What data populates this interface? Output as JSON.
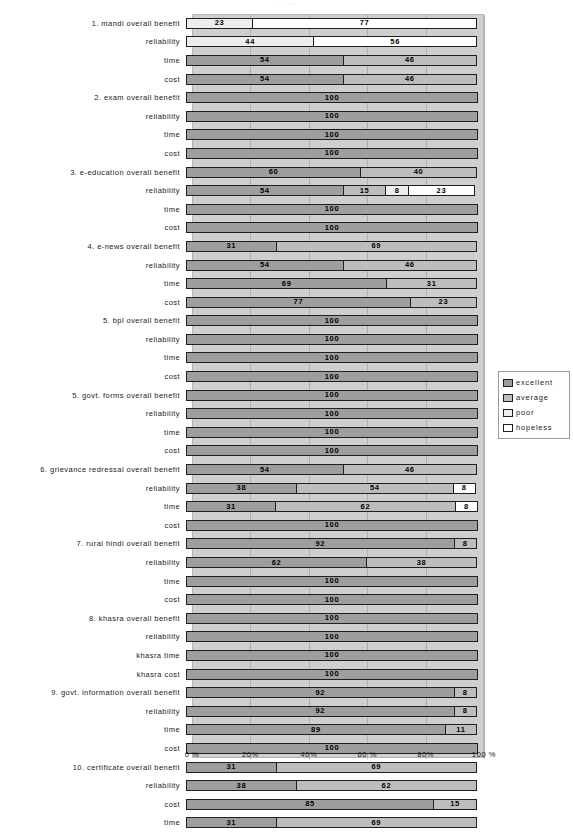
{
  "top_artifact_text": "·        ·                    ·                         ·",
  "chart_data": {
    "type": "bar",
    "subtype": "horizontal-stacked-100",
    "title": "",
    "xlabel": "",
    "ylabel": "",
    "xlim": [
      0,
      100
    ],
    "xticks": [
      "0 %",
      "20%",
      "40%",
      "60 %",
      "80%",
      "100 %"
    ],
    "xtick_values": [
      0,
      20,
      40,
      60,
      80,
      100
    ],
    "grid": true,
    "legend_position": "right",
    "legend": [
      "excellent",
      "average",
      "poor",
      "hopeless"
    ],
    "series_colors": {
      "excellent": "#9e9e9e",
      "average": "#bdbdbd",
      "poor": "#ededed",
      "hopeless": "#ffffff"
    },
    "categories": [
      "1. mandi overall benefit",
      "reliability",
      "time",
      "cost",
      "2. exam overall benefit",
      "reliability",
      "time",
      "cost",
      "3. e-education overall benefit",
      "reliability",
      "time",
      "cost",
      "4. e-news overall benefit",
      "reliability",
      "time",
      "cost",
      "5. bpl overall benefit",
      "reliability",
      "time",
      "cost",
      "5. govt. forms overall benefit",
      "reliability",
      "time",
      "cost",
      "6. grievance redressal overall benefit",
      "reliability",
      "time",
      "cost",
      "7. rural hindi overall benefit",
      "reliability",
      "time",
      "cost",
      "8. khasra overall benefit",
      "reliability",
      "khasra time",
      "khasra cost",
      "9. govt. information overall benefit",
      "reliability",
      "time",
      "cost",
      "10. certificate overall benefit",
      "reliability",
      "cost",
      "time"
    ],
    "rows": [
      {
        "label": "1. mandi overall benefit",
        "segments": [
          {
            "cls": "poor",
            "value": 23
          },
          {
            "cls": "hopeless",
            "value": 77
          }
        ]
      },
      {
        "label": "reliability",
        "segments": [
          {
            "cls": "poor",
            "value": 44
          },
          {
            "cls": "hopeless",
            "value": 56
          }
        ]
      },
      {
        "label": "time",
        "segments": [
          {
            "cls": "excellent",
            "value": 54
          },
          {
            "cls": "average",
            "value": 46
          }
        ]
      },
      {
        "label": "cost",
        "segments": [
          {
            "cls": "excellent",
            "value": 54
          },
          {
            "cls": "average",
            "value": 46
          }
        ]
      },
      {
        "label": "2. exam overall benefit",
        "segments": [
          {
            "cls": "excellent",
            "value": 100
          }
        ]
      },
      {
        "label": "reliability",
        "segments": [
          {
            "cls": "excellent",
            "value": 100
          }
        ]
      },
      {
        "label": "time",
        "segments": [
          {
            "cls": "excellent",
            "value": 100
          }
        ]
      },
      {
        "label": "cost",
        "segments": [
          {
            "cls": "excellent",
            "value": 100
          }
        ]
      },
      {
        "label": "3. e-education overall benefit",
        "segments": [
          {
            "cls": "excellent",
            "value": 60
          },
          {
            "cls": "average",
            "value": 40
          }
        ]
      },
      {
        "label": "reliability",
        "segments": [
          {
            "cls": "excellent",
            "value": 54
          },
          {
            "cls": "average",
            "value": 15
          },
          {
            "cls": "poor",
            "value": 8
          },
          {
            "cls": "hopeless",
            "value": 23
          }
        ]
      },
      {
        "label": "time",
        "segments": [
          {
            "cls": "excellent",
            "value": 100
          }
        ]
      },
      {
        "label": "cost",
        "segments": [
          {
            "cls": "excellent",
            "value": 100
          }
        ]
      },
      {
        "label": "4. e-news overall benefit",
        "segments": [
          {
            "cls": "excellent",
            "value": 31
          },
          {
            "cls": "average",
            "value": 69
          }
        ]
      },
      {
        "label": "reliability",
        "segments": [
          {
            "cls": "excellent",
            "value": 54
          },
          {
            "cls": "average",
            "value": 46
          }
        ]
      },
      {
        "label": "time",
        "segments": [
          {
            "cls": "excellent",
            "value": 69
          },
          {
            "cls": "average",
            "value": 31
          }
        ]
      },
      {
        "label": "cost",
        "segments": [
          {
            "cls": "excellent",
            "value": 77
          },
          {
            "cls": "average",
            "value": 23
          }
        ]
      },
      {
        "label": "5. bpl overall benefit",
        "segments": [
          {
            "cls": "excellent",
            "value": 100
          }
        ]
      },
      {
        "label": "reliability",
        "segments": [
          {
            "cls": "excellent",
            "value": 100
          }
        ]
      },
      {
        "label": "time",
        "segments": [
          {
            "cls": "excellent",
            "value": 100
          }
        ]
      },
      {
        "label": "cost",
        "segments": [
          {
            "cls": "excellent",
            "value": 100
          }
        ]
      },
      {
        "label": "5. govt. forms overall benefit",
        "segments": [
          {
            "cls": "excellent",
            "value": 100
          }
        ]
      },
      {
        "label": "reliability",
        "segments": [
          {
            "cls": "excellent",
            "value": 100
          }
        ]
      },
      {
        "label": "time",
        "segments": [
          {
            "cls": "excellent",
            "value": 100
          }
        ]
      },
      {
        "label": "cost",
        "segments": [
          {
            "cls": "excellent",
            "value": 100
          }
        ]
      },
      {
        "label": "6. grievance redressal overall benefit",
        "segments": [
          {
            "cls": "excellent",
            "value": 54
          },
          {
            "cls": "average",
            "value": 46
          }
        ]
      },
      {
        "label": "reliability",
        "segments": [
          {
            "cls": "excellent",
            "value": 38
          },
          {
            "cls": "average",
            "value": 54
          },
          {
            "cls": "hopeless",
            "value": 8
          }
        ]
      },
      {
        "label": "time",
        "segments": [
          {
            "cls": "excellent",
            "value": 31
          },
          {
            "cls": "average",
            "value": 62
          },
          {
            "cls": "hopeless",
            "value": 8
          }
        ]
      },
      {
        "label": "cost",
        "segments": [
          {
            "cls": "excellent",
            "value": 100
          }
        ]
      },
      {
        "label": "7. rural hindi overall benefit",
        "segments": [
          {
            "cls": "excellent",
            "value": 92
          },
          {
            "cls": "average",
            "value": 8
          }
        ]
      },
      {
        "label": "reliability",
        "segments": [
          {
            "cls": "excellent",
            "value": 62
          },
          {
            "cls": "average",
            "value": 38
          }
        ]
      },
      {
        "label": "time",
        "segments": [
          {
            "cls": "excellent",
            "value": 100
          }
        ]
      },
      {
        "label": "cost",
        "segments": [
          {
            "cls": "excellent",
            "value": 100
          }
        ]
      },
      {
        "label": "8. khasra overall benefit",
        "segments": [
          {
            "cls": "excellent",
            "value": 100
          }
        ]
      },
      {
        "label": "reliability",
        "segments": [
          {
            "cls": "excellent",
            "value": 100
          }
        ]
      },
      {
        "label": "khasra time",
        "segments": [
          {
            "cls": "excellent",
            "value": 100
          }
        ]
      },
      {
        "label": "khasra cost",
        "segments": [
          {
            "cls": "excellent",
            "value": 100
          }
        ]
      },
      {
        "label": "9. govt. information overall benefit",
        "segments": [
          {
            "cls": "excellent",
            "value": 92
          },
          {
            "cls": "average",
            "value": 8
          }
        ]
      },
      {
        "label": "reliability",
        "segments": [
          {
            "cls": "excellent",
            "value": 92
          },
          {
            "cls": "average",
            "value": 8
          }
        ]
      },
      {
        "label": "time",
        "segments": [
          {
            "cls": "excellent",
            "value": 89
          },
          {
            "cls": "average",
            "value": 11
          }
        ]
      },
      {
        "label": "cost",
        "segments": [
          {
            "cls": "excellent",
            "value": 100
          }
        ]
      },
      {
        "label": "10. certificate overall benefit",
        "segments": [
          {
            "cls": "excellent",
            "value": 31
          },
          {
            "cls": "average",
            "value": 69
          }
        ]
      },
      {
        "label": "reliability",
        "segments": [
          {
            "cls": "excellent",
            "value": 38
          },
          {
            "cls": "average",
            "value": 62
          }
        ]
      },
      {
        "label": "cost",
        "segments": [
          {
            "cls": "excellent",
            "value": 85
          },
          {
            "cls": "average",
            "value": 15
          }
        ]
      },
      {
        "label": "time",
        "segments": [
          {
            "cls": "excellent",
            "value": 31
          },
          {
            "cls": "average",
            "value": 69
          }
        ]
      }
    ]
  }
}
